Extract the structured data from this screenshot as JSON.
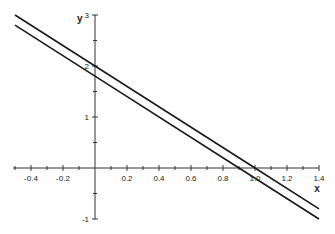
{
  "chart_data": {
    "type": "line",
    "title": "",
    "xlabel": "x",
    "ylabel": "y",
    "xlim": [
      -0.5,
      1.4
    ],
    "ylim": [
      -1,
      3
    ],
    "grid": false,
    "legend": null,
    "x_ticks": [
      -0.4,
      -0.2,
      0.2,
      0.4,
      0.6,
      0.8,
      1.0,
      1.2,
      1.4
    ],
    "x_tick_labels": [
      "-0.4",
      "-0.2",
      "0.2",
      "0.4",
      "0.6",
      "0.8",
      "1.0",
      "1.2",
      "1.4"
    ],
    "x_minor_ticks": [
      -0.5,
      -0.3,
      -0.1,
      0.1,
      0.3,
      0.5,
      0.7,
      0.9,
      1.1,
      1.3
    ],
    "y_ticks": [
      -1,
      1,
      2,
      3
    ],
    "y_tick_labels": [
      "-1",
      "1",
      "2",
      "3"
    ],
    "y_minor_ticks": [
      -0.5,
      0.5,
      1.5,
      2.5
    ],
    "series": [
      {
        "name": "upper line (y = 2 - 2x)",
        "x": [
          -0.5,
          0,
          1.0,
          1.4
        ],
        "y": [
          3.0,
          2.0,
          0.0,
          -0.8
        ]
      },
      {
        "name": "lower line (y = 1.8 - 2x)",
        "x": [
          -0.5,
          0,
          0.9,
          1.4
        ],
        "y": [
          2.8,
          1.8,
          0.0,
          -1.0
        ]
      }
    ]
  },
  "layout": {
    "origin_px": [
      95,
      168
    ],
    "px_per_x_unit": 160,
    "px_per_y_unit": 51
  }
}
